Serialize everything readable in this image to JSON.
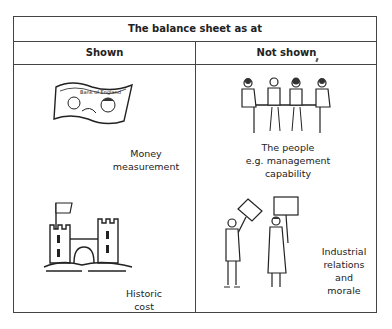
{
  "table": {
    "title": "The balance sheet as at",
    "columns": [
      "Shown",
      "Not shown"
    ],
    "shown": [
      {
        "icon": "banknote-icon",
        "caption_lines": [
          "Money",
          "measurement"
        ]
      },
      {
        "icon": "castle-icon",
        "caption_lines": [
          "Historic",
          "cost"
        ]
      }
    ],
    "not_shown": [
      {
        "icon": "meeting-people-icon",
        "caption_lines": [
          "The people",
          "e.g. management",
          "capability"
        ]
      },
      {
        "icon": "protesters-icon",
        "caption_lines": [
          "Industrial",
          "relations",
          "and",
          "morale"
        ]
      }
    ]
  }
}
